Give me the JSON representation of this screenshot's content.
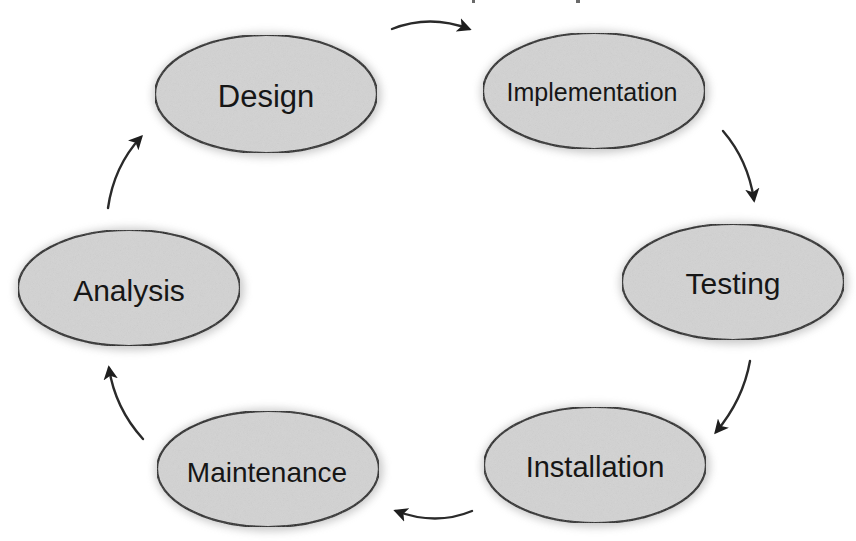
{
  "diagram": {
    "type": "cycle",
    "colors": {
      "node_fill": "#d3d3d3",
      "node_stroke": "#1c1c1c",
      "text": "#161616",
      "arrow": "#2a2a2a",
      "background": "#ffffff"
    },
    "nodes": [
      {
        "id": "design",
        "label": "Design"
      },
      {
        "id": "implementation",
        "label": "Implementation"
      },
      {
        "id": "testing",
        "label": "Testing"
      },
      {
        "id": "installation",
        "label": "Installation"
      },
      {
        "id": "maintenance",
        "label": "Maintenance"
      },
      {
        "id": "analysis",
        "label": "Analysis"
      }
    ],
    "edges": [
      {
        "from": "Design",
        "to": "Implementation"
      },
      {
        "from": "Implementation",
        "to": "Testing"
      },
      {
        "from": "Testing",
        "to": "Installation"
      },
      {
        "from": "Installation",
        "to": "Maintenance"
      },
      {
        "from": "Maintenance",
        "to": "Analysis"
      },
      {
        "from": "Analysis",
        "to": "Design"
      }
    ]
  }
}
